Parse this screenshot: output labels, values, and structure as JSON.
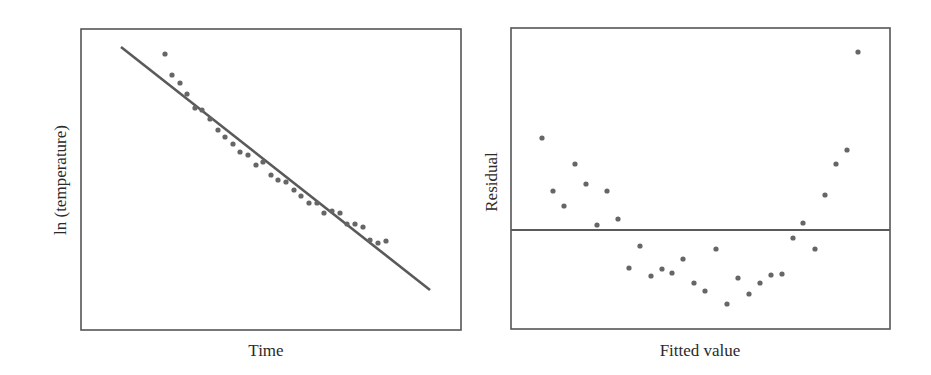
{
  "colors": {
    "frame": "#555555",
    "line": "#5a5a5a",
    "point": "#666666",
    "text": "#2a2a2a"
  },
  "chart_data": [
    {
      "type": "scatter",
      "title": "",
      "xlabel": "Time",
      "ylabel": "ln (temperature)",
      "grid": false,
      "legend": null,
      "frame_px": {
        "x0": 81,
        "y0": 29,
        "x1": 461,
        "y1": 330
      },
      "fit_line_px": {
        "x1": 121,
        "y1": 47,
        "x2": 430,
        "y2": 290
      },
      "points_px": [
        [
          165,
          54
        ],
        [
          172,
          75
        ],
        [
          180,
          83
        ],
        [
          187,
          94
        ],
        [
          195,
          108
        ],
        [
          202,
          110
        ],
        [
          210,
          119
        ],
        [
          218,
          130
        ],
        [
          225,
          137
        ],
        [
          233,
          144
        ],
        [
          240,
          152
        ],
        [
          248,
          155
        ],
        [
          256,
          165
        ],
        [
          263,
          162
        ],
        [
          271,
          175
        ],
        [
          278,
          180
        ],
        [
          286,
          182
        ],
        [
          294,
          190
        ],
        [
          301,
          196
        ],
        [
          309,
          203
        ],
        [
          317,
          203
        ],
        [
          324,
          213
        ],
        [
          332,
          211
        ],
        [
          340,
          213
        ],
        [
          347,
          224
        ],
        [
          355,
          224
        ],
        [
          363,
          227
        ],
        [
          370,
          240
        ],
        [
          378,
          243
        ],
        [
          386,
          241
        ]
      ],
      "annotations": [
        "Least-squares fit line (decreasing)"
      ]
    },
    {
      "type": "scatter",
      "title": "",
      "xlabel": "Fitted value",
      "ylabel": "Residual",
      "grid": false,
      "legend": null,
      "frame_px": {
        "x0": 511,
        "y0": 28,
        "x1": 890,
        "y1": 329
      },
      "zero_line_px": {
        "y": 230
      },
      "points_px": [
        [
          542,
          138
        ],
        [
          553,
          191
        ],
        [
          564,
          206
        ],
        [
          575,
          164
        ],
        [
          586,
          184
        ],
        [
          597,
          225
        ],
        [
          607,
          191
        ],
        [
          618,
          219
        ],
        [
          629,
          268
        ],
        [
          640,
          246
        ],
        [
          651,
          276
        ],
        [
          662,
          269
        ],
        [
          672,
          273
        ],
        [
          683,
          259
        ],
        [
          694,
          283
        ],
        [
          705,
          291
        ],
        [
          716,
          249
        ],
        [
          727,
          304
        ],
        [
          738,
          278
        ],
        [
          749,
          294
        ],
        [
          760,
          283
        ],
        [
          771,
          275
        ],
        [
          782,
          274
        ],
        [
          793,
          238
        ],
        [
          803,
          223
        ],
        [
          815,
          249
        ],
        [
          825,
          195
        ],
        [
          836,
          164
        ],
        [
          847,
          150
        ],
        [
          858,
          52
        ]
      ],
      "annotations": [
        "Horizontal reference line at residual = 0",
        "U-shaped residual pattern"
      ]
    }
  ],
  "labels": {
    "left_x": "Time",
    "left_y": "ln (temperature)",
    "right_x": "Fitted value",
    "right_y": "Residual"
  }
}
